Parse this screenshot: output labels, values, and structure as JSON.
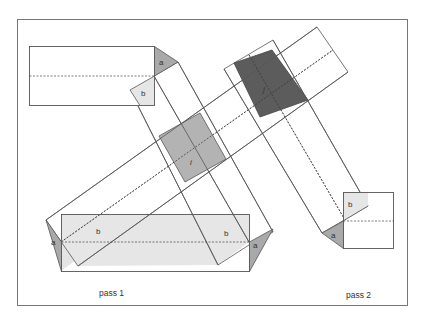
{
  "diagram": {
    "captions": {
      "pass1": "pass 1",
      "pass2": "pass 2"
    },
    "labels": {
      "a": "a",
      "b": "b",
      "i": "i",
      "j": "j"
    },
    "colors": {
      "frame": "#777777",
      "line": "#555555",
      "light_fill": "#e6e6e6",
      "mid_fill": "#b0b0b0",
      "dark_fill": "#5a5a5a",
      "triangle_fill": "#a8a8a8"
    }
  }
}
